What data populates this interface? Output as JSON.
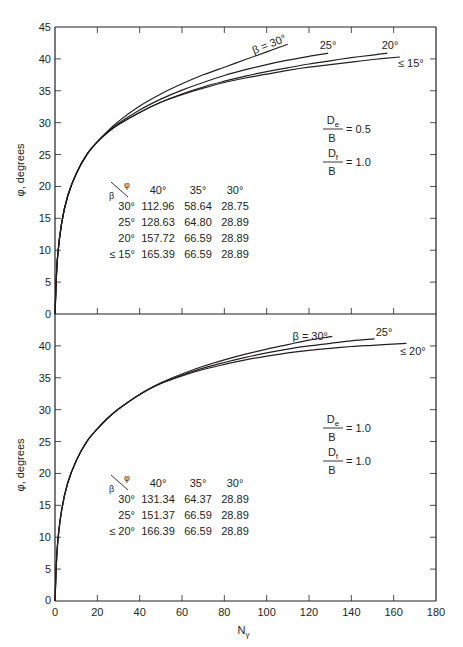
{
  "figure": {
    "x_label": "N",
    "x_label_sub": "γ",
    "x_ticks": [
      0,
      20,
      40,
      60,
      80,
      100,
      120,
      140,
      160,
      180
    ],
    "line_color": "#231f20"
  },
  "chart_data": [
    {
      "type": "line",
      "panel": "top",
      "title": "",
      "xlabel": "Nγ",
      "ylabel": "φ, degrees",
      "xlim": [
        0,
        180
      ],
      "ylim": [
        0,
        45
      ],
      "y_ticks": [
        0,
        5,
        10,
        15,
        20,
        25,
        30,
        35,
        40,
        45
      ],
      "grid": false,
      "parameters": [
        {
          "num": "D",
          "num_sub": "e",
          "den": "B",
          "value": "= 0.5"
        },
        {
          "num": "D",
          "num_sub": "f",
          "den": "B",
          "value": "= 1.0"
        }
      ],
      "series": [
        {
          "name": "β = 30°",
          "label": "β = 30°",
          "x": [
            0,
            1,
            3,
            6,
            10,
            15,
            20,
            25,
            30,
            40,
            50,
            60,
            70,
            80,
            90,
            100,
            110
          ],
          "y": [
            0,
            8,
            14,
            18.5,
            22,
            25,
            27,
            28.7,
            30.2,
            32.6,
            34.5,
            36.1,
            37.5,
            38.7,
            39.9,
            41.1,
            42.3
          ]
        },
        {
          "name": "β = 25°",
          "label": "25°",
          "x": [
            0,
            1,
            3,
            6,
            10,
            15,
            20,
            25,
            30,
            40,
            50,
            60,
            70,
            80,
            90,
            100,
            110,
            120,
            129
          ],
          "y": [
            0,
            8,
            14,
            18.5,
            22,
            25,
            27,
            28.6,
            29.9,
            32.0,
            33.7,
            35.1,
            36.3,
            37.4,
            38.3,
            39.1,
            39.8,
            40.4,
            40.9
          ]
        },
        {
          "name": "β = 20°",
          "label": "20°",
          "x": [
            0,
            1,
            3,
            6,
            10,
            15,
            20,
            25,
            30,
            40,
            50,
            60,
            70,
            80,
            90,
            100,
            110,
            120,
            130,
            140,
            150,
            157
          ],
          "y": [
            0,
            8,
            14,
            18.5,
            22,
            25,
            27,
            28.5,
            29.7,
            31.6,
            33.2,
            34.5,
            35.6,
            36.5,
            37.3,
            38.0,
            38.6,
            39.2,
            39.7,
            40.2,
            40.6,
            40.9
          ]
        },
        {
          "name": "β ≤ 15°",
          "label": "≤ 15°",
          "x": [
            0,
            1,
            3,
            6,
            10,
            15,
            20,
            25,
            30,
            40,
            50,
            60,
            70,
            80,
            90,
            100,
            110,
            120,
            130,
            140,
            150,
            163
          ],
          "y": [
            0,
            8,
            14,
            18.5,
            22,
            25,
            27,
            28.5,
            29.7,
            31.6,
            33.2,
            34.4,
            35.4,
            36.3,
            37.0,
            37.6,
            38.2,
            38.7,
            39.1,
            39.5,
            39.9,
            40.3
          ]
        }
      ],
      "table": {
        "corner_top": "φ",
        "corner_bottom": "β",
        "columns": [
          "40°",
          "35°",
          "30°"
        ],
        "rows": [
          {
            "beta": "30°",
            "values": [
              "112.96",
              "58.64",
              "28.75"
            ]
          },
          {
            "beta": "25°",
            "values": [
              "128.63",
              "64.80",
              "28.89"
            ]
          },
          {
            "beta": "20°",
            "values": [
              "157.72",
              "66.59",
              "28.89"
            ]
          },
          {
            "beta": "≤ 15°",
            "values": [
              "165.39",
              "66.59",
              "28.89"
            ]
          }
        ]
      }
    },
    {
      "type": "line",
      "panel": "bottom",
      "title": "",
      "xlabel": "Nγ",
      "ylabel": "φ, degrees",
      "xlim": [
        0,
        180
      ],
      "ylim": [
        0,
        44
      ],
      "y_ticks": [
        0,
        5,
        10,
        15,
        20,
        25,
        30,
        35,
        40
      ],
      "grid": false,
      "parameters": [
        {
          "num": "D",
          "num_sub": "e",
          "den": "B",
          "value": "= 1.0"
        },
        {
          "num": "D",
          "num_sub": "f",
          "den": "B",
          "value": "= 1.0"
        }
      ],
      "series": [
        {
          "name": "β = 30°",
          "label": "β = 30°",
          "x": [
            0,
            1,
            3,
            6,
            10,
            15,
            20,
            25,
            30,
            40,
            50,
            60,
            70,
            80,
            90,
            100,
            110,
            120,
            131
          ],
          "y": [
            0,
            8,
            14,
            18.5,
            22,
            25,
            27,
            28.7,
            30.1,
            32.4,
            34.2,
            35.6,
            36.8,
            37.8,
            38.7,
            39.5,
            40.2,
            40.9,
            41.5
          ]
        },
        {
          "name": "β = 25°",
          "label": "25°",
          "x": [
            0,
            1,
            3,
            6,
            10,
            15,
            20,
            25,
            30,
            40,
            50,
            60,
            70,
            80,
            90,
            100,
            110,
            120,
            130,
            140,
            151
          ],
          "y": [
            0,
            8,
            14,
            18.5,
            22,
            25,
            27,
            28.7,
            30.1,
            32.4,
            34.1,
            35.4,
            36.5,
            37.4,
            38.2,
            38.9,
            39.5,
            40.0,
            40.4,
            40.8,
            41.1
          ]
        },
        {
          "name": "β ≤ 20°",
          "label": "≤ 20°",
          "x": [
            0,
            1,
            3,
            6,
            10,
            15,
            20,
            25,
            30,
            40,
            50,
            60,
            70,
            80,
            90,
            100,
            110,
            120,
            130,
            140,
            150,
            166
          ],
          "y": [
            0,
            8,
            14,
            18.5,
            22,
            25,
            27,
            28.7,
            30.1,
            32.4,
            34.1,
            35.3,
            36.3,
            37.1,
            37.8,
            38.4,
            38.9,
            39.3,
            39.6,
            39.9,
            40.1,
            40.4
          ]
        }
      ],
      "table": {
        "corner_top": "φ",
        "corner_bottom": "β",
        "columns": [
          "40°",
          "35°",
          "30°"
        ],
        "rows": [
          {
            "beta": "30°",
            "values": [
              "131.34",
              "64.37",
              "28.89"
            ]
          },
          {
            "beta": "25°",
            "values": [
              "151.37",
              "66.59",
              "28.89"
            ]
          },
          {
            "beta": "≤ 20°",
            "values": [
              "166.39",
              "66.59",
              "28.89"
            ]
          }
        ]
      }
    }
  ]
}
